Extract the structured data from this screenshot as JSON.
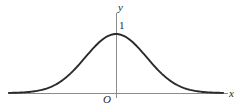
{
  "figure": {
    "kind": "bell-curve-diagram",
    "background_color": "#ffffff",
    "width": 240,
    "height": 112
  },
  "axes": {
    "x_axis_label": "x",
    "y_axis_label": "y",
    "origin_label": "O",
    "axis_color": "#8c8c8c",
    "x_axis": {
      "y": 93,
      "x_start": 8,
      "x_end": 228
    },
    "y_axis": {
      "x": 116,
      "y_start": 13,
      "y_end": 98
    }
  },
  "ticks": {
    "y_ticks": [
      {
        "label": "1",
        "value": 1
      }
    ]
  },
  "curve": {
    "name": "gaussian-bell-curve",
    "color": "#2b2b2b",
    "stroke_width": 1.9,
    "peak_label": "1",
    "peak_x_pixel": 116,
    "peak_y_pixel": 34,
    "sigma_pixel": 30.6,
    "baseline_y_pixel": 93
  },
  "chart_data": {
    "type": "line",
    "title": "",
    "xlabel": "x",
    "ylabel": "y",
    "grid": false,
    "legend": null,
    "annotations": [
      {
        "text": "1",
        "x": 0,
        "y": 1,
        "note": "peak height marked on y-axis"
      },
      {
        "text": "O",
        "x": 0,
        "y": 0,
        "note": "origin"
      }
    ],
    "xlim": [
      -3.5,
      3.7
    ],
    "ylim": [
      0,
      1.15
    ],
    "series": [
      {
        "name": "standard normal bell curve",
        "formula": "y = exp(-x^2 / 2)",
        "x": [
          -3.5,
          -3.25,
          -3.0,
          -2.75,
          -2.5,
          -2.25,
          -2.0,
          -1.75,
          -1.5,
          -1.25,
          -1.0,
          -0.75,
          -0.5,
          -0.25,
          0.0,
          0.25,
          0.5,
          0.75,
          1.0,
          1.25,
          1.5,
          1.75,
          2.0,
          2.25,
          2.5,
          2.75,
          3.0,
          3.25,
          3.5
        ],
        "y": [
          0.002,
          0.005,
          0.011,
          0.023,
          0.044,
          0.079,
          0.135,
          0.216,
          0.325,
          0.458,
          0.607,
          0.755,
          0.882,
          0.969,
          1.0,
          0.969,
          0.882,
          0.755,
          0.607,
          0.458,
          0.325,
          0.216,
          0.135,
          0.079,
          0.044,
          0.023,
          0.011,
          0.005,
          0.002
        ]
      }
    ]
  }
}
